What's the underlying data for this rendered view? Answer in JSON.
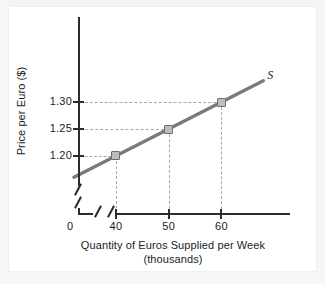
{
  "chart_data": {
    "type": "line",
    "title": "",
    "xlabel": "Quantity of Euros Supplied per Week",
    "xlabel_line2": "(thousands)",
    "ylabel": "Price per Euro ($)",
    "origin_label": "0",
    "curve_label": "S",
    "x": [
      40,
      50,
      60
    ],
    "values": [
      1.2,
      1.25,
      1.3
    ],
    "series": [
      {
        "name": "S",
        "x": [
          40,
          50,
          60
        ],
        "values": [
          1.2,
          1.25,
          1.3
        ]
      }
    ],
    "xticks": [
      "40",
      "50",
      "60"
    ],
    "yticks": [
      "1.30",
      "1.25",
      "1.20"
    ],
    "xlim": [
      33,
      73
    ],
    "ylim": [
      1.155,
      1.345
    ],
    "axis_break_x": true,
    "axis_break_y": true,
    "grid": "dashed-guides-to-points",
    "legend": "inline-curve-label",
    "line_color": "#7a7a7a",
    "marker_fill": "#bdbdbd",
    "marker_edge": "#6e6e6e",
    "grid_color": "#a8a8a8",
    "axis_color": "#2b2b2b"
  },
  "ticks": {
    "y": [
      {
        "label": "1.30",
        "value": 1.3
      },
      {
        "label": "1.25",
        "value": 1.25
      },
      {
        "label": "1.20",
        "value": 1.2
      }
    ],
    "x": [
      {
        "label": "40",
        "value": 40
      },
      {
        "label": "50",
        "value": 50
      },
      {
        "label": "60",
        "value": 60
      }
    ]
  }
}
